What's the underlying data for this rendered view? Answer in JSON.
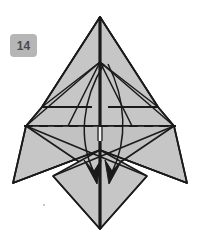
{
  "figure": {
    "kind": "origami-fold-diagram",
    "step_badge": {
      "label": "14",
      "background_color": "#b6b6b6",
      "text_color": "#4a4a4a"
    },
    "colors": {
      "paper_front": "#c6c6c6",
      "paper_shadow": "#b9b9b9",
      "paper_back": "#ffffff",
      "outline": "#1a1a1a",
      "crease_solid": "#1a1a1a",
      "crease_dashed": "#1a1a1a",
      "arrow": "#1a1a1a",
      "background": "#ffffff"
    },
    "canvas": {
      "width": 200,
      "height": 251
    },
    "annotations": {
      "valley_fold_line": "horizontal dashed crease across the model at mid-height",
      "fold_arrows": "two curved arrows pointing downward on either side of the centre line",
      "arrow_count": 2,
      "dashed_line_count": 1
    },
    "geometry": {
      "top_apex": [
        100,
        17
      ],
      "centre_junction": [
        100,
        62
      ],
      "bottom_apex": [
        100,
        229
      ],
      "left_wing_tip": [
        13,
        183
      ],
      "right_wing_tip": [
        187,
        183
      ],
      "left_mid_point": [
        26,
        126
      ],
      "right_mid_point": [
        174,
        126
      ],
      "dashed_line_y": 126,
      "dashed_line_x_range": [
        24,
        176
      ]
    }
  }
}
